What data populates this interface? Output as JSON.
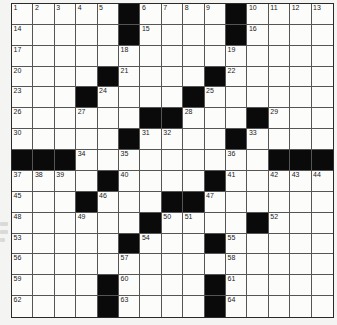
{
  "puzzle": {
    "rows": 15,
    "cols": 15,
    "colors": {
      "black": "#0a0a0a",
      "white": "#fcfcfb",
      "line": "#555555"
    },
    "layout": [
      "1,2,3,4,5,#,6,7,8,9,#,10,11,12,13",
      "14,.,.,.,.,#,15,.,.,.,#,16,.,.,.",
      "17,.,.,.,.,18,.,.,.,.,19,.,.,.,.",
      "20,.,.,.,#,21,.,.,.,#,22,.,.,.,.",
      "23,.,.,#,24,.,.,.,#,25,.,.,.,.,.",
      "26,.,.,27,.,.,#,#,28,.,.,#,29,.,.",
      "30,.,.,.,.,#,31,32,.,.,#,33,.,.,.",
      "#,#,#,34,.,35,.,.,.,.,36,.,#,#,#",
      "37,38,39,.,#,40,.,.,.,#,41,.,42,43,44",
      "45,.,.,#,46,.,.,#,#,47,.,.,.,.,.",
      "48,.,.,49,.,.,#,50,51,.,.,#,52,.,.",
      "53,.,.,.,.,#,54,.,.,#,55,.,.,.,.",
      "56,.,.,.,.,57,.,.,.,.,58,.,.,.,.",
      "59,.,.,.,#,60,.,.,.,#,61,.,.,.,.",
      "62,.,.,.,#,63,.,.,.,#,64,.,.,.,."
    ]
  }
}
